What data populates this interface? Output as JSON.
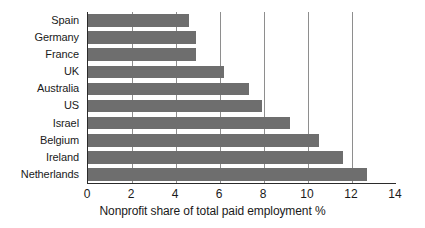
{
  "chart_data": {
    "type": "bar",
    "orientation": "horizontal",
    "title": "",
    "xlabel": "Nonprofit share of total paid employment %",
    "ylabel": "",
    "categories": [
      "Spain",
      "Germany",
      "France",
      "UK",
      "Australia",
      "US",
      "Israel",
      "Belgium",
      "Ireland",
      "Netherlands"
    ],
    "values": [
      4.6,
      4.9,
      4.9,
      6.2,
      7.3,
      7.9,
      9.2,
      10.5,
      11.6,
      12.7
    ],
    "xlim": [
      0,
      14
    ],
    "xticks": [
      0,
      2,
      4,
      6,
      8,
      10,
      12,
      14
    ],
    "xtick_labels": [
      "0",
      "2",
      "4",
      "6",
      "8",
      "10",
      "12",
      "14"
    ],
    "gridlines": [
      2,
      4,
      6,
      8,
      10,
      12
    ],
    "grid": true,
    "legend": null,
    "bar_color": "#6e6e6e",
    "axis_color": "#2b2b2b",
    "grid_color": "#8e8e8e",
    "text_color": "#1a1a1a"
  }
}
